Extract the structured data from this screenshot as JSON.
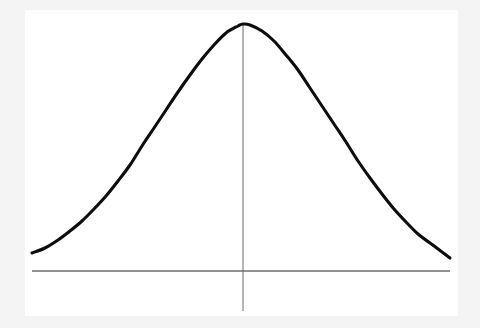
{
  "figure": {
    "width": 480,
    "height": 328,
    "background_color": "#f4f4f5",
    "canvas_color": "#ffffff",
    "canvas_rect": {
      "x": 25,
      "y": 10,
      "width": 433,
      "height": 306
    }
  },
  "chart_data": {
    "type": "line",
    "title": "",
    "subtitle": "",
    "xlabel": "",
    "ylabel": "",
    "grid": false,
    "legend": null,
    "legend_position": "none",
    "annotations": [],
    "tick_labels": {
      "x": [],
      "y": []
    },
    "xlim": [
      32,
      450
    ],
    "ylim": [
      271,
      24
    ],
    "series": [
      {
        "name": "normal-distribution-curve",
        "color": "#0d0d0d",
        "stroke_width": 3.1,
        "peak": {
          "x": 243,
          "y": 24
        },
        "mean_x": 243,
        "baseline_y": 271,
        "inflection_points": [
          {
            "x": 145,
            "y": 140
          },
          {
            "x": 345,
            "y": 140
          }
        ],
        "points": [
          {
            "x": 32,
            "y": 253
          },
          {
            "x": 45,
            "y": 248
          },
          {
            "x": 58,
            "y": 240
          },
          {
            "x": 70,
            "y": 231
          },
          {
            "x": 82,
            "y": 221
          },
          {
            "x": 94,
            "y": 209
          },
          {
            "x": 106,
            "y": 196
          },
          {
            "x": 118,
            "y": 181
          },
          {
            "x": 130,
            "y": 165
          },
          {
            "x": 142,
            "y": 146
          },
          {
            "x": 154,
            "y": 128
          },
          {
            "x": 166,
            "y": 110
          },
          {
            "x": 178,
            "y": 92
          },
          {
            "x": 190,
            "y": 75
          },
          {
            "x": 202,
            "y": 59
          },
          {
            "x": 214,
            "y": 45
          },
          {
            "x": 226,
            "y": 33
          },
          {
            "x": 238,
            "y": 26
          },
          {
            "x": 243,
            "y": 24
          },
          {
            "x": 250,
            "y": 25
          },
          {
            "x": 262,
            "y": 31
          },
          {
            "x": 274,
            "y": 41
          },
          {
            "x": 286,
            "y": 55
          },
          {
            "x": 298,
            "y": 70
          },
          {
            "x": 310,
            "y": 88
          },
          {
            "x": 322,
            "y": 106
          },
          {
            "x": 334,
            "y": 124
          },
          {
            "x": 346,
            "y": 142
          },
          {
            "x": 358,
            "y": 161
          },
          {
            "x": 370,
            "y": 178
          },
          {
            "x": 382,
            "y": 194
          },
          {
            "x": 394,
            "y": 209
          },
          {
            "x": 406,
            "y": 222
          },
          {
            "x": 418,
            "y": 234
          },
          {
            "x": 430,
            "y": 243
          },
          {
            "x": 442,
            "y": 252
          },
          {
            "x": 450,
            "y": 258
          }
        ]
      }
    ],
    "axes": [
      {
        "name": "horizontal-baseline",
        "orientation": "horizontal",
        "color": "#6e6e6e",
        "stroke_width": 1.6,
        "x1": 32,
        "y1": 271,
        "x2": 450,
        "y2": 271
      },
      {
        "name": "vertical-center-line",
        "orientation": "vertical",
        "color": "#9d9d9d",
        "stroke_width": 1.5,
        "x1": 243,
        "y1": 23,
        "x2": 243,
        "y2": 311
      }
    ]
  }
}
